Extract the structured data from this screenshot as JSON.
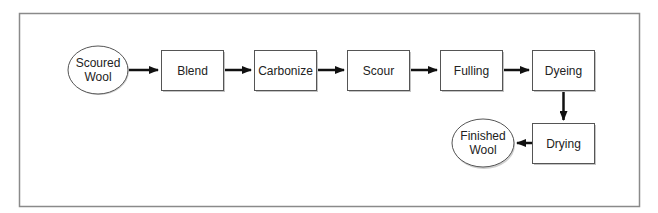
{
  "diagram": {
    "type": "flowchart",
    "colors": {
      "frame": "#8a8a8a",
      "stroke": "#555555",
      "shadow": "#bdbdbd",
      "arrow": "#111111",
      "text": "#222222",
      "fill": "#ffffff"
    },
    "nodes": [
      {
        "id": "scoured-wool",
        "shape": "ellipse",
        "lines": [
          "Scoured",
          "Wool"
        ]
      },
      {
        "id": "blend",
        "shape": "box",
        "label": "Blend"
      },
      {
        "id": "carbonize",
        "shape": "box",
        "label": "Carbonize"
      },
      {
        "id": "scour",
        "shape": "box",
        "label": "Scour"
      },
      {
        "id": "fulling",
        "shape": "box",
        "label": "Fulling"
      },
      {
        "id": "dyeing",
        "shape": "box",
        "label": "Dyeing"
      },
      {
        "id": "drying",
        "shape": "box",
        "label": "Drying"
      },
      {
        "id": "finished-wool",
        "shape": "ellipse",
        "lines": [
          "Finished",
          "Wool"
        ]
      }
    ],
    "edges": [
      {
        "from": "scoured-wool",
        "to": "blend"
      },
      {
        "from": "blend",
        "to": "carbonize"
      },
      {
        "from": "carbonize",
        "to": "scour"
      },
      {
        "from": "scour",
        "to": "fulling"
      },
      {
        "from": "fulling",
        "to": "dyeing"
      },
      {
        "from": "dyeing",
        "to": "drying"
      },
      {
        "from": "drying",
        "to": "finished-wool"
      }
    ]
  }
}
